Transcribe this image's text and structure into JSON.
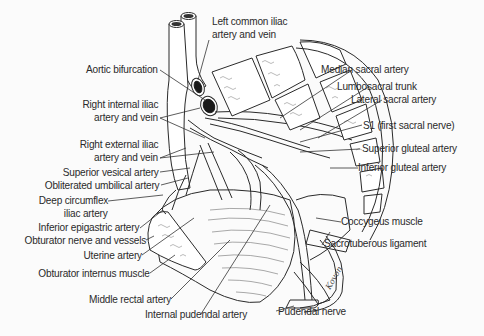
{
  "figure": {
    "signature": "Kovon"
  },
  "labels": {
    "left_common_iliac": [
      "Left common iliac",
      "artery and vein"
    ],
    "aortic_bifurcation": "Aortic bifurcation",
    "right_internal_iliac": [
      "Right internal iliac",
      "artery and vein"
    ],
    "right_external_iliac": [
      "Right external iliac",
      "artery and vein"
    ],
    "superior_vesical": "Superior vesical artery",
    "obliterated_umbilical": "Obliterated umbilical artery",
    "deep_circumflex": [
      "Deep circumflex",
      "iliac artery"
    ],
    "inferior_epigastric": "Inferior epigastric artery",
    "obturator_nerve": "Obturator nerve and vessels",
    "uterine": "Uterine artery",
    "obturator_internus": "Obturator internus muscle",
    "middle_rectal": "Middle rectal artery",
    "internal_pudendal": "Internal pudendal artery",
    "pudendal_nerve": "Pudendal nerve",
    "median_sacral": "Median sacral artery",
    "lumbosacral_trunk": "Lumbosacral trunk",
    "lateral_sacral": "Lateral sacral artery",
    "s1": "S1 (first sacral nerve)",
    "superior_gluteal": "Superior gluteal artery",
    "inferior_gluteal": "Inferior gluteal artery",
    "coccygeus": "Coccygeus muscle",
    "sacrotuberous": "Sacrotuberous ligament"
  }
}
